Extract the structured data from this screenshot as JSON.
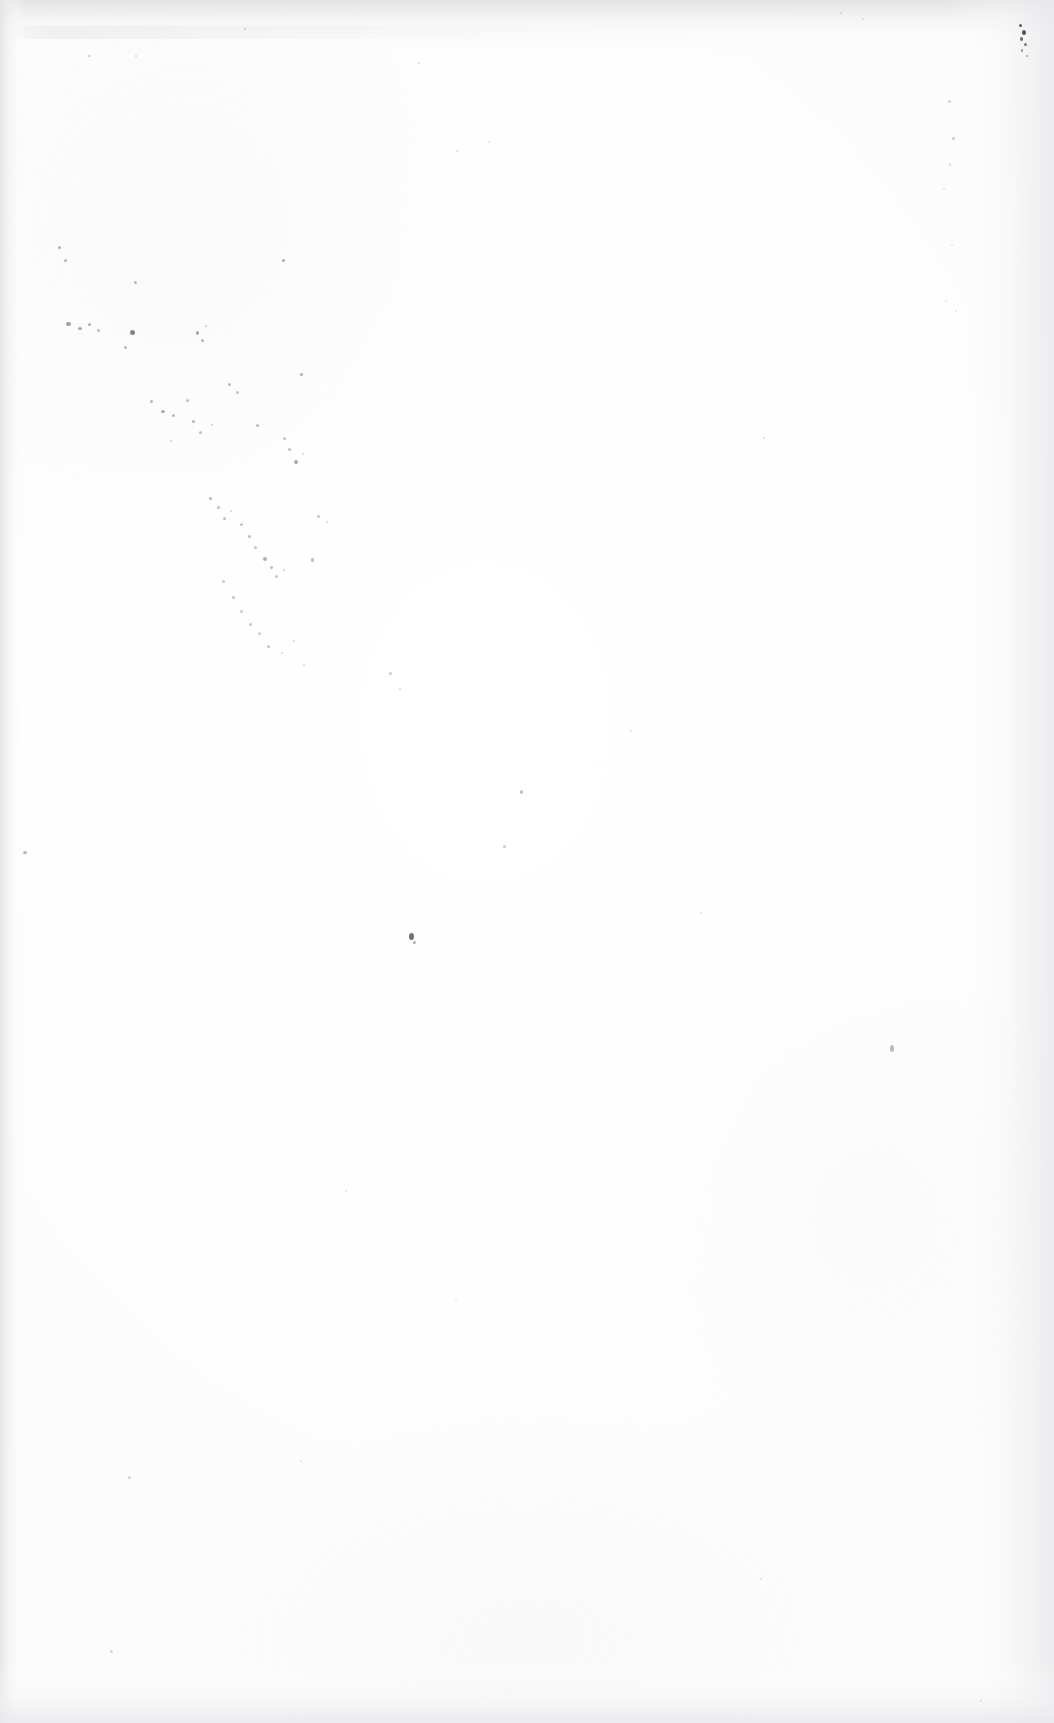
{
  "page": {
    "kind": "scanned-blank-page",
    "description": "Blank scanned page",
    "width_px": 1054,
    "height_px": 1723,
    "visible_text": "",
    "text_content_present": false
  },
  "colors": {
    "paper": "#fdfdfd",
    "paper_highlight": "#ffffff",
    "edge_shadow": "#e2e2e4",
    "speck": "#3a3a3c",
    "page_background": "#ffffff"
  },
  "artifacts": {
    "top_edge_shadow": {
      "label": "top-edge-shadow",
      "height_px": 52
    },
    "left_edge_shadow": {
      "label": "left-edge-shadow",
      "width_px": 26
    },
    "right_edge_shadow": {
      "label": "right-edge-shadow",
      "width_px": 112
    },
    "bottom_edge_shadow": {
      "label": "bottom-edge-shadow",
      "height_px": 64
    },
    "top_streak": {
      "label": "top-texture-streak",
      "width_px": 820
    }
  },
  "specks": [
    {
      "x": 1019,
      "y": 24,
      "w": 3,
      "h": 3,
      "o": 0.8
    },
    {
      "x": 1022,
      "y": 30,
      "w": 4,
      "h": 5,
      "o": 0.88
    },
    {
      "x": 1020,
      "y": 37,
      "w": 3,
      "h": 4,
      "o": 0.74
    },
    {
      "x": 1024,
      "y": 43,
      "w": 3,
      "h": 3,
      "o": 0.66
    },
    {
      "x": 1021,
      "y": 49,
      "w": 2,
      "h": 3,
      "o": 0.55
    },
    {
      "x": 1026,
      "y": 55,
      "w": 2,
      "h": 2,
      "o": 0.42
    },
    {
      "x": 840,
      "y": 12,
      "w": 2,
      "h": 2,
      "o": 0.2
    },
    {
      "x": 862,
      "y": 18,
      "w": 2,
      "h": 2,
      "o": 0.16
    },
    {
      "x": 244,
      "y": 28,
      "w": 2,
      "h": 2,
      "o": 0.22
    },
    {
      "x": 418,
      "y": 62,
      "w": 2,
      "h": 2,
      "o": 0.18
    },
    {
      "x": 88,
      "y": 55,
      "w": 3,
      "h": 2,
      "o": 0.24
    },
    {
      "x": 135,
      "y": 55,
      "w": 2,
      "h": 2,
      "o": 0.2
    },
    {
      "x": 948,
      "y": 100,
      "w": 3,
      "h": 3,
      "o": 0.22
    },
    {
      "x": 952,
      "y": 137,
      "w": 3,
      "h": 3,
      "o": 0.25
    },
    {
      "x": 949,
      "y": 163,
      "w": 2,
      "h": 3,
      "o": 0.18
    },
    {
      "x": 943,
      "y": 188,
      "w": 2,
      "h": 2,
      "o": 0.16
    },
    {
      "x": 951,
      "y": 244,
      "w": 2,
      "h": 2,
      "o": 0.14
    },
    {
      "x": 945,
      "y": 300,
      "w": 2,
      "h": 2,
      "o": 0.14
    },
    {
      "x": 955,
      "y": 310,
      "w": 2,
      "h": 2,
      "o": 0.12
    },
    {
      "x": 890,
      "y": 1045,
      "w": 4,
      "h": 7,
      "o": 0.34
    },
    {
      "x": 58,
      "y": 246,
      "w": 3,
      "h": 3,
      "o": 0.4
    },
    {
      "x": 64,
      "y": 259,
      "w": 3,
      "h": 3,
      "o": 0.36
    },
    {
      "x": 282,
      "y": 259,
      "w": 3,
      "h": 3,
      "o": 0.42
    },
    {
      "x": 134,
      "y": 281,
      "w": 3,
      "h": 3,
      "o": 0.35
    },
    {
      "x": 456,
      "y": 150,
      "w": 2,
      "h": 2,
      "o": 0.18
    },
    {
      "x": 488,
      "y": 141,
      "w": 2,
      "h": 2,
      "o": 0.15
    },
    {
      "x": 66,
      "y": 322,
      "w": 5,
      "h": 4,
      "o": 0.48
    },
    {
      "x": 78,
      "y": 327,
      "w": 4,
      "h": 3,
      "o": 0.44
    },
    {
      "x": 88,
      "y": 323,
      "w": 3,
      "h": 3,
      "o": 0.38
    },
    {
      "x": 97,
      "y": 329,
      "w": 3,
      "h": 3,
      "o": 0.32
    },
    {
      "x": 130,
      "y": 330,
      "w": 5,
      "h": 5,
      "o": 0.62
    },
    {
      "x": 124,
      "y": 346,
      "w": 3,
      "h": 3,
      "o": 0.34
    },
    {
      "x": 196,
      "y": 331,
      "w": 3,
      "h": 4,
      "o": 0.44
    },
    {
      "x": 201,
      "y": 339,
      "w": 3,
      "h": 3,
      "o": 0.36
    },
    {
      "x": 205,
      "y": 325,
      "w": 2,
      "h": 2,
      "o": 0.26
    },
    {
      "x": 300,
      "y": 373,
      "w": 3,
      "h": 3,
      "o": 0.4
    },
    {
      "x": 228,
      "y": 383,
      "w": 3,
      "h": 3,
      "o": 0.34
    },
    {
      "x": 236,
      "y": 391,
      "w": 3,
      "h": 3,
      "o": 0.3
    },
    {
      "x": 150,
      "y": 400,
      "w": 3,
      "h": 3,
      "o": 0.36
    },
    {
      "x": 161,
      "y": 410,
      "w": 4,
      "h": 3,
      "o": 0.42
    },
    {
      "x": 172,
      "y": 414,
      "w": 3,
      "h": 3,
      "o": 0.34
    },
    {
      "x": 186,
      "y": 399,
      "w": 3,
      "h": 3,
      "o": 0.32
    },
    {
      "x": 192,
      "y": 420,
      "w": 3,
      "h": 3,
      "o": 0.38
    },
    {
      "x": 199,
      "y": 431,
      "w": 3,
      "h": 3,
      "o": 0.3
    },
    {
      "x": 211,
      "y": 424,
      "w": 2,
      "h": 2,
      "o": 0.24
    },
    {
      "x": 256,
      "y": 424,
      "w": 3,
      "h": 3,
      "o": 0.34
    },
    {
      "x": 170,
      "y": 440,
      "w": 2,
      "h": 2,
      "o": 0.22
    },
    {
      "x": 283,
      "y": 437,
      "w": 3,
      "h": 3,
      "o": 0.32
    },
    {
      "x": 288,
      "y": 448,
      "w": 3,
      "h": 3,
      "o": 0.3
    },
    {
      "x": 294,
      "y": 460,
      "w": 4,
      "h": 4,
      "o": 0.44
    },
    {
      "x": 302,
      "y": 453,
      "w": 2,
      "h": 2,
      "o": 0.22
    },
    {
      "x": 209,
      "y": 497,
      "w": 3,
      "h": 3,
      "o": 0.36
    },
    {
      "x": 217,
      "y": 506,
      "w": 3,
      "h": 3,
      "o": 0.32
    },
    {
      "x": 223,
      "y": 517,
      "w": 3,
      "h": 3,
      "o": 0.34
    },
    {
      "x": 230,
      "y": 510,
      "w": 2,
      "h": 2,
      "o": 0.22
    },
    {
      "x": 240,
      "y": 523,
      "w": 3,
      "h": 3,
      "o": 0.3
    },
    {
      "x": 248,
      "y": 535,
      "w": 3,
      "h": 3,
      "o": 0.33
    },
    {
      "x": 254,
      "y": 546,
      "w": 3,
      "h": 3,
      "o": 0.3
    },
    {
      "x": 263,
      "y": 557,
      "w": 4,
      "h": 4,
      "o": 0.4
    },
    {
      "x": 270,
      "y": 566,
      "w": 3,
      "h": 3,
      "o": 0.34
    },
    {
      "x": 275,
      "y": 575,
      "w": 3,
      "h": 3,
      "o": 0.3
    },
    {
      "x": 283,
      "y": 569,
      "w": 2,
      "h": 2,
      "o": 0.24
    },
    {
      "x": 317,
      "y": 515,
      "w": 3,
      "h": 3,
      "o": 0.3
    },
    {
      "x": 326,
      "y": 521,
      "w": 2,
      "h": 2,
      "o": 0.22
    },
    {
      "x": 311,
      "y": 558,
      "w": 3,
      "h": 4,
      "o": 0.36
    },
    {
      "x": 222,
      "y": 580,
      "w": 3,
      "h": 3,
      "o": 0.28
    },
    {
      "x": 232,
      "y": 596,
      "w": 3,
      "h": 3,
      "o": 0.3
    },
    {
      "x": 240,
      "y": 610,
      "w": 3,
      "h": 3,
      "o": 0.28
    },
    {
      "x": 249,
      "y": 623,
      "w": 3,
      "h": 3,
      "o": 0.3
    },
    {
      "x": 258,
      "y": 632,
      "w": 3,
      "h": 3,
      "o": 0.26
    },
    {
      "x": 267,
      "y": 645,
      "w": 3,
      "h": 3,
      "o": 0.28
    },
    {
      "x": 281,
      "y": 652,
      "w": 2,
      "h": 2,
      "o": 0.22
    },
    {
      "x": 293,
      "y": 640,
      "w": 2,
      "h": 2,
      "o": 0.2
    },
    {
      "x": 303,
      "y": 664,
      "w": 2,
      "h": 2,
      "o": 0.2
    },
    {
      "x": 389,
      "y": 672,
      "w": 3,
      "h": 3,
      "o": 0.26
    },
    {
      "x": 399,
      "y": 688,
      "w": 2,
      "h": 2,
      "o": 0.2
    },
    {
      "x": 520,
      "y": 790,
      "w": 3,
      "h": 4,
      "o": 0.34
    },
    {
      "x": 503,
      "y": 845,
      "w": 3,
      "h": 3,
      "o": 0.28
    },
    {
      "x": 23,
      "y": 851,
      "w": 4,
      "h": 3,
      "o": 0.36
    },
    {
      "x": 409,
      "y": 933,
      "w": 5,
      "h": 7,
      "o": 0.72
    },
    {
      "x": 413,
      "y": 941,
      "w": 3,
      "h": 3,
      "o": 0.4
    },
    {
      "x": 630,
      "y": 730,
      "w": 2,
      "h": 2,
      "o": 0.16
    },
    {
      "x": 700,
      "y": 912,
      "w": 2,
      "h": 2,
      "o": 0.14
    },
    {
      "x": 763,
      "y": 437,
      "w": 2,
      "h": 2,
      "o": 0.18
    },
    {
      "x": 775,
      "y": 215,
      "w": 2,
      "h": 2,
      "o": 0.14
    },
    {
      "x": 345,
      "y": 1190,
      "w": 2,
      "h": 2,
      "o": 0.14
    },
    {
      "x": 128,
      "y": 1476,
      "w": 3,
      "h": 3,
      "o": 0.22
    },
    {
      "x": 110,
      "y": 1650,
      "w": 3,
      "h": 3,
      "o": 0.2
    },
    {
      "x": 300,
      "y": 1460,
      "w": 2,
      "h": 2,
      "o": 0.14
    },
    {
      "x": 455,
      "y": 1300,
      "w": 2,
      "h": 2,
      "o": 0.12
    },
    {
      "x": 760,
      "y": 1578,
      "w": 2,
      "h": 2,
      "o": 0.14
    },
    {
      "x": 980,
      "y": 1700,
      "w": 2,
      "h": 2,
      "o": 0.14
    }
  ]
}
